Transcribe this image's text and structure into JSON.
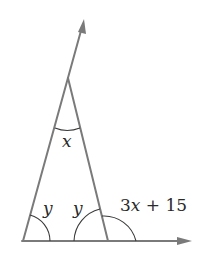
{
  "diagram": {
    "type": "geometry-triangle",
    "stroke_color": "#7a7a7a",
    "arc_color": "#3a3a3a",
    "label_color": "#2a2a2a",
    "points": {
      "ray_tip": [
        84,
        20
      ],
      "apex": [
        68,
        78
      ],
      "bottom_left": [
        23,
        241
      ],
      "bottom_right": [
        108,
        241
      ],
      "baseline_tip": [
        190,
        241
      ]
    },
    "labels": {
      "apex_angle": "x",
      "bottom_left_angle": "y",
      "bottom_right_interior_angle": "y",
      "exterior_angle": "3x + 15"
    }
  }
}
